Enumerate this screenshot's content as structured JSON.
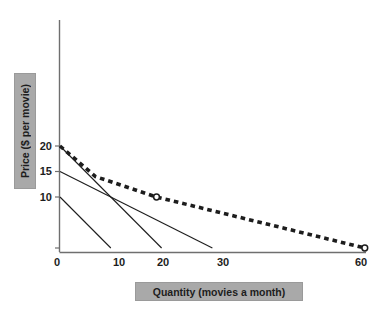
{
  "chart_data": {
    "type": "line",
    "title": "",
    "xlabel": "Quantity (movies a month)",
    "ylabel": "Price ($ per movie)",
    "xlim": [
      0,
      65
    ],
    "ylim": [
      0,
      25
    ],
    "grid": false,
    "legend_position": "none",
    "xticks": [
      {
        "value": 0,
        "label": "0"
      },
      {
        "value": 10,
        "label": "10"
      },
      {
        "value": 20,
        "label": "20"
      },
      {
        "value": 30,
        "label": "30"
      },
      {
        "value": 60,
        "label": "60"
      }
    ],
    "yticks": [
      {
        "value": 10,
        "label": "10"
      },
      {
        "value": 15,
        "label": "15"
      },
      {
        "value": 20,
        "label": "20"
      }
    ],
    "series": [
      {
        "name": "individual-demand-1",
        "style": "solid",
        "color": "#1d1d1d",
        "x": [
          0,
          10
        ],
        "y": [
          10,
          0
        ]
      },
      {
        "name": "individual-demand-2",
        "style": "solid",
        "color": "#1d1d1d",
        "x": [
          0,
          20
        ],
        "y": [
          20,
          0
        ]
      },
      {
        "name": "individual-demand-3",
        "style": "solid",
        "color": "#1d1d1d",
        "x": [
          0,
          30
        ],
        "y": [
          15,
          0
        ]
      },
      {
        "name": "market-demand",
        "style": "dashed",
        "color": "#1d1d1d",
        "x": [
          0,
          7,
          19,
          60
        ],
        "y": [
          20,
          14,
          10,
          0
        ],
        "markers": [
          {
            "x": 19,
            "y": 10,
            "shape": "open-circle"
          },
          {
            "x": 60,
            "y": 0,
            "shape": "open-circle"
          }
        ]
      }
    ]
  },
  "axes": {
    "x_axis_name": "horizontal-axis",
    "y_axis_name": "vertical-axis"
  }
}
